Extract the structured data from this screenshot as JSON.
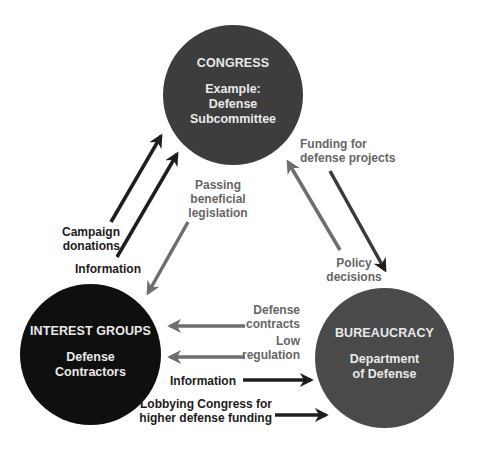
{
  "colors": {
    "congress_fill": "#3d3d3d",
    "interest_fill": "#0f0f0f",
    "bureaucracy_fill": "#4a4a4a",
    "dark_arrow": "#1e1e1e",
    "grey_arrow": "#6e6e6e",
    "node_text": "#e9e9e9"
  },
  "nodes": {
    "congress": {
      "title": "CONGRESS",
      "line1": "Example:",
      "line2": "Defense",
      "line3": "Subcommittee"
    },
    "interest_groups": {
      "title": "INTEREST GROUPS",
      "line1": "Defense",
      "line2": "Contractors"
    },
    "bureaucracy": {
      "title": "BUREAUCRACY",
      "line1": "Department",
      "line2": "of Defense"
    }
  },
  "edges": {
    "campaign_donations": {
      "line1": "Campaign",
      "line2": "donations",
      "from": "interest_groups",
      "to": "congress"
    },
    "information_to_congress": {
      "text": "Information",
      "from": "interest_groups",
      "to": "congress"
    },
    "passing_legislation": {
      "line1": "Passing",
      "line2": "beneficial",
      "line3": "legislation",
      "from": "congress",
      "to": "interest_groups"
    },
    "funding": {
      "line1": "Funding for",
      "line2": "defense projects",
      "from": "congress",
      "to": "bureaucracy"
    },
    "policy_decisions": {
      "line1": "Policy",
      "line2": "decisions",
      "from": "bureaucracy",
      "to": "congress"
    },
    "defense_contracts": {
      "line1": "Defense",
      "line2": "contracts",
      "from": "bureaucracy",
      "to": "interest_groups"
    },
    "low_regulation": {
      "line1": "Low",
      "line2": "regulation",
      "from": "bureaucracy",
      "to": "interest_groups"
    },
    "information_to_bureaucracy": {
      "text": "Information",
      "from": "interest_groups",
      "to": "bureaucracy"
    },
    "lobbying": {
      "line1": "Lobbying Congress for",
      "line2": "higher defense funding",
      "from": "interest_groups",
      "to": "bureaucracy"
    }
  }
}
